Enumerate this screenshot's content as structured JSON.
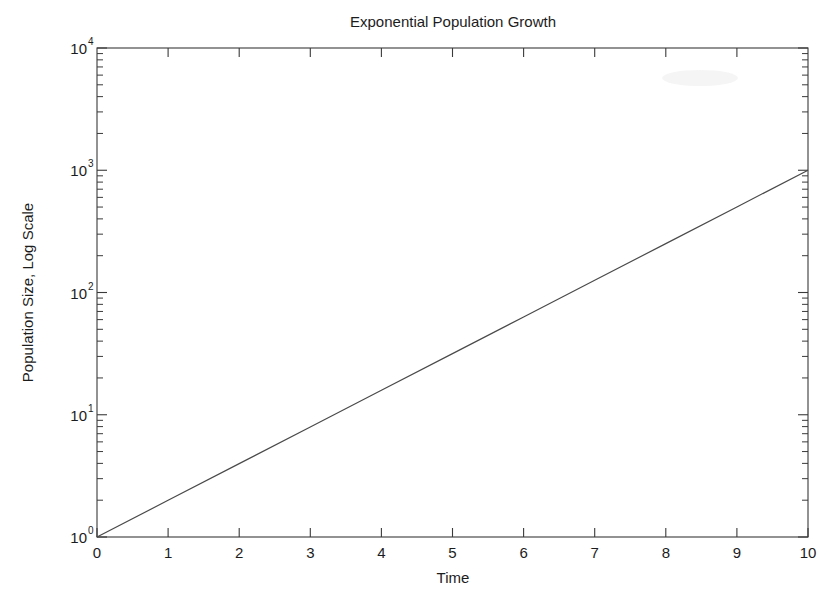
{
  "figure": {
    "background_color": "#ffffff",
    "line_color": "#4a4a4a",
    "axis_color": "#3a3a3a",
    "text_color": "#1c1c1c"
  },
  "chart_data": {
    "type": "line",
    "title": "Exponential Population Growth",
    "xlabel": "Time",
    "ylabel": "Population Size, Log Scale",
    "yscale": "log",
    "xscale": "linear",
    "grid": false,
    "legend": null,
    "xlim": [
      0,
      10
    ],
    "ylim": [
      1,
      10000
    ],
    "xticks": [
      0,
      1,
      2,
      3,
      4,
      5,
      6,
      7,
      8,
      9,
      10
    ],
    "xticklabels": [
      "0",
      "1",
      "2",
      "3",
      "4",
      "5",
      "6",
      "7",
      "8",
      "9",
      "10"
    ],
    "yticks": [
      1,
      10,
      100,
      1000,
      10000
    ],
    "yticklabels": [
      "10^0",
      "10^1",
      "10^2",
      "10^3",
      "10^4"
    ],
    "ytick_mantissas": [
      "10",
      "10",
      "10",
      "10",
      "10"
    ],
    "ytick_exponents": [
      "0",
      "1",
      "2",
      "3",
      "4"
    ],
    "series": [
      {
        "name": "Population",
        "x": [
          0,
          1,
          2,
          3,
          4,
          5,
          6,
          7,
          8,
          9,
          10
        ],
        "values": [
          1,
          1.9953,
          3.9811,
          7.9433,
          15.849,
          31.623,
          63.096,
          125.89,
          251.19,
          501.19,
          1000
        ]
      }
    ]
  }
}
